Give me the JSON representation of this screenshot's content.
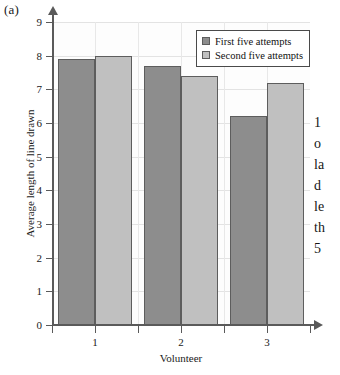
{
  "figure_label": "(a)",
  "margin_text_lines": [
    "1",
    "o",
    "la",
    "d",
    "le",
    "th",
    "5"
  ],
  "colors": {
    "series1": "#8d8d8d",
    "series2": "#c0c0c0",
    "bar_outline": "#5d5d5d",
    "axis": "#5a5a5a",
    "plot_background": "#fdfdfd",
    "gridline": "#e3e3e3"
  },
  "chart_data": {
    "type": "bar",
    "title": "",
    "xlabel": "Volunteer",
    "ylabel": "Average length of line drawn",
    "categories": [
      "1",
      "2",
      "3"
    ],
    "series": [
      {
        "name": "First five attempts",
        "values": [
          7.9,
          7.7,
          6.2
        ]
      },
      {
        "name": "Second five attempts",
        "values": [
          8.0,
          7.4,
          7.2
        ]
      }
    ],
    "ylim": [
      0,
      9
    ],
    "yticks": [
      0,
      1,
      2,
      3,
      4,
      5,
      6,
      7,
      8,
      9
    ],
    "ytick_labels": [
      "0",
      "1",
      "2",
      "3",
      "4",
      "5",
      "6",
      "7",
      "8",
      "9"
    ],
    "grid": true,
    "legend_position": "top-right"
  }
}
